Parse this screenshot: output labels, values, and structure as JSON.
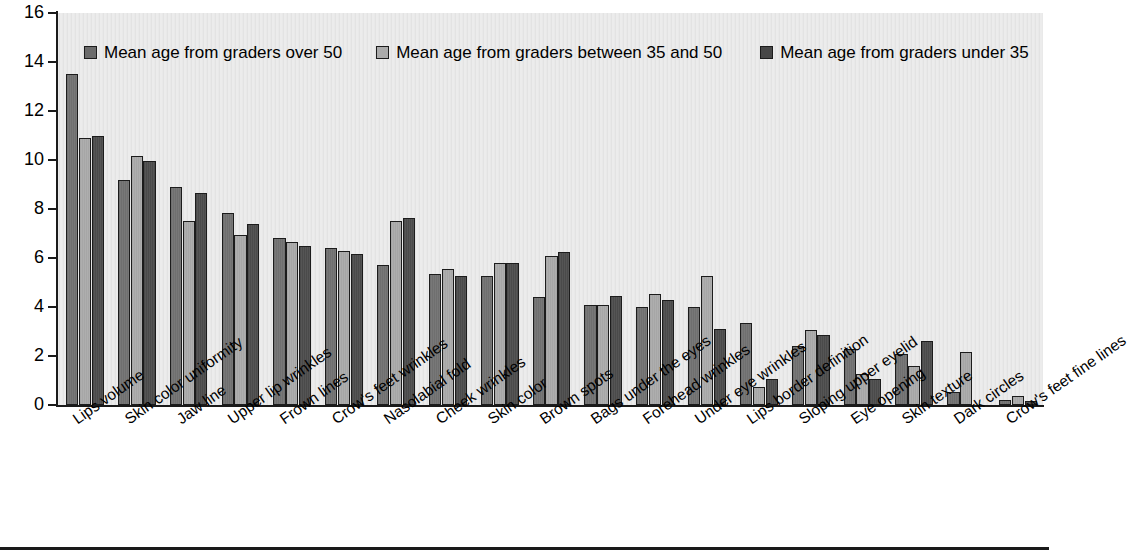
{
  "chart": {
    "type": "bar",
    "ylabel": "Relative contribution in the PLS model (%)",
    "xlabel": "",
    "title": "",
    "ylim": [
      0,
      16
    ],
    "ytick_step": 2,
    "yticks": [
      "0",
      "2",
      "4",
      "6",
      "8",
      "10",
      "12",
      "14",
      "16"
    ],
    "grid": false,
    "legend_position": "top-inside",
    "plot_background": "#e8e8e8",
    "series_colors": [
      "#6f6f6f",
      "#a8a8a8",
      "#4a4a4a"
    ]
  },
  "legend": {
    "items": [
      {
        "label": "Mean age from graders over 50",
        "color": "#6b6b6b"
      },
      {
        "label": "Mean age from graders between 35 and 50",
        "color": "#ababab"
      },
      {
        "label": "Mean age from graders under 35",
        "color": "#474747"
      }
    ]
  },
  "chart_data": {
    "type": "bar",
    "title": "",
    "xlabel": "",
    "ylabel": "Relative contribution in the PLS model (%)",
    "ylim": [
      0,
      16
    ],
    "yticks": [
      0,
      2,
      4,
      6,
      8,
      10,
      12,
      14,
      16
    ],
    "grid": false,
    "legend_position": "top-inside",
    "categories": [
      "Lips volume",
      "Skin color uniformity",
      "Jaw line",
      "Upper lip wrinkles",
      "Frown lines",
      "Crow's feet wrinkles",
      "Nasolabial fold",
      "Cheek wrinkles",
      "Skin color",
      "Brown spots",
      "Bags under the eyes",
      "Forehead wrinkles",
      "Under eye wrinkles",
      "Lips border definition",
      "Sloping upper eyelid",
      "Eye opening",
      "Skin texture",
      "Dark circles",
      "Crow's feet fine lines"
    ],
    "series": [
      {
        "name": "Mean age from graders over 50",
        "color": "#6f6f6f",
        "values": [
          13.5,
          9.2,
          8.9,
          7.85,
          6.8,
          6.4,
          5.7,
          5.35,
          5.25,
          4.4,
          4.1,
          4.0,
          4.0,
          3.35,
          2.4,
          2.3,
          2.1,
          0.55,
          0.2
        ]
      },
      {
        "name": "Mean age from graders between 35 and 50",
        "color": "#a8a8a8",
        "values": [
          10.9,
          10.15,
          7.5,
          6.95,
          6.65,
          6.3,
          7.5,
          5.55,
          5.8,
          6.1,
          4.1,
          4.55,
          5.25,
          0.75,
          3.05,
          1.25,
          1.6,
          2.15,
          0.35
        ]
      },
      {
        "name": "Mean age from graders under 35",
        "color": "#4a4a4a",
        "values": [
          11.0,
          9.95,
          8.65,
          7.4,
          6.5,
          6.15,
          7.65,
          5.25,
          5.8,
          6.25,
          4.45,
          4.3,
          3.1,
          1.05,
          2.85,
          1.05,
          2.6,
          0.0,
          0.15
        ]
      }
    ]
  }
}
